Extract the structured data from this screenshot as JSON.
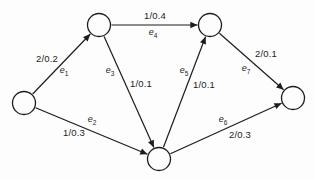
{
  "diagram": {
    "kind": "directed-flow-network-graph",
    "background_color": "#fdfdfd",
    "stroke_color": "#1c1c1c",
    "text_color": "#1c1c1c",
    "node_fill_color": "#fdfdfd",
    "nodes": [
      {
        "id": "source",
        "x": 24,
        "y": 103,
        "r": 11.5
      },
      {
        "id": "top-left",
        "x": 99,
        "y": 25,
        "r": 11.5
      },
      {
        "id": "top-right",
        "x": 210,
        "y": 25,
        "r": 11.5
      },
      {
        "id": "bottom-middle",
        "x": 159,
        "y": 159,
        "r": 11.5
      },
      {
        "id": "sink",
        "x": 293,
        "y": 98,
        "r": 11.5
      }
    ],
    "edges": [
      {
        "id": "e1",
        "name_base": "e",
        "name_sub": "1",
        "value": "2/0.2",
        "from": "source",
        "to": "top-left",
        "value_pos": {
          "x": 47,
          "y": 58
        },
        "name_pos": {
          "x": 64,
          "y": 70
        }
      },
      {
        "id": "e2",
        "name_base": "e",
        "name_sub": "2",
        "value": "1/0.3",
        "from": "source",
        "to": "bottom-middle",
        "value_pos": {
          "x": 74,
          "y": 132
        },
        "name_pos": {
          "x": 92,
          "y": 119
        }
      },
      {
        "id": "e3",
        "name_base": "e",
        "name_sub": "3",
        "value": "1/0.1",
        "from": "top-left",
        "to": "bottom-middle",
        "value_pos": {
          "x": 141,
          "y": 83
        },
        "name_pos": {
          "x": 110,
          "y": 70
        }
      },
      {
        "id": "e4",
        "name_base": "e",
        "name_sub": "4",
        "value": "1/0.4",
        "from": "top-left",
        "to": "top-right",
        "value_pos": {
          "x": 155,
          "y": 15
        },
        "name_pos": {
          "x": 153,
          "y": 32
        }
      },
      {
        "id": "e5",
        "name_base": "e",
        "name_sub": "5",
        "value": "1/0.1",
        "from": "bottom-middle",
        "to": "top-right",
        "value_pos": {
          "x": 204,
          "y": 84
        },
        "name_pos": {
          "x": 184,
          "y": 70
        }
      },
      {
        "id": "e6",
        "name_base": "e",
        "name_sub": "6",
        "value": "2/0.3",
        "from": "bottom-middle",
        "to": "sink",
        "value_pos": {
          "x": 240,
          "y": 134
        },
        "name_pos": {
          "x": 223,
          "y": 119
        }
      },
      {
        "id": "e7",
        "name_base": "e",
        "name_sub": "7",
        "value": "2/0.1",
        "from": "top-right",
        "to": "sink",
        "value_pos": {
          "x": 266,
          "y": 53
        },
        "name_pos": {
          "x": 246,
          "y": 68
        }
      }
    ]
  }
}
